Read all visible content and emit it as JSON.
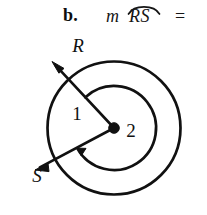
{
  "problem": {
    "label": "b.",
    "measure_operator": "m",
    "arc_name": "RS",
    "equals": "=",
    "arc_overbar_icon": "arc-overbar-icon"
  },
  "figure": {
    "name": "concentric-circles-two-rays-diagram",
    "center_point": {
      "name": "center-vertex-dot",
      "cx": 114,
      "cy": 98,
      "r": 5.2
    },
    "circles": [
      {
        "name": "outer-circle",
        "cx": 114,
        "cy": 98,
        "r": 66.5,
        "stroke": "#111111",
        "stroke_width": 2.6
      },
      {
        "name": "inner-arc-circle",
        "cx": 114,
        "cy": 98,
        "r": 42.0,
        "stroke": "#111111",
        "stroke_width": 2.6
      }
    ],
    "rays": [
      {
        "name": "ray-to-R",
        "label": "R",
        "direction_deg": 133,
        "length": 86,
        "label_x": 78,
        "label_y": 22
      },
      {
        "name": "ray-to-S",
        "label": "S",
        "direction_deg": 208,
        "length": 84,
        "label_x": 36,
        "label_y": 145
      }
    ],
    "angle_labels": [
      {
        "name": "angle-label-1",
        "text": "1",
        "x": 78,
        "y": 88
      },
      {
        "name": "angle-label-2",
        "text": "2",
        "x": 128,
        "y": 106
      }
    ],
    "arc_marker": {
      "name": "arc-direction-arrowhead",
      "description": "arrowhead on inner arc pointing toward ray S"
    },
    "colors": {
      "stroke": "#111111",
      "background": "#ffffff",
      "text": "#161616"
    }
  }
}
